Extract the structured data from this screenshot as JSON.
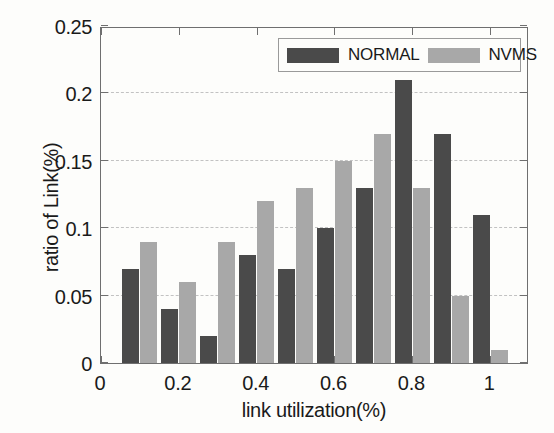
{
  "chart_data": {
    "type": "bar",
    "title": "",
    "xlabel": "link utilization(%)",
    "ylabel": "ratio of Link(%)",
    "categories": [
      0.1,
      0.2,
      0.3,
      0.4,
      0.5,
      0.6,
      0.7,
      0.8,
      0.9,
      1.0
    ],
    "series": [
      {
        "name": "NORMAL",
        "color": "#4a4a4a",
        "values": [
          0.07,
          0.04,
          0.02,
          0.08,
          0.07,
          0.1,
          0.13,
          0.21,
          0.17,
          0.11
        ]
      },
      {
        "name": "NVMS",
        "color": "#a8a8a8",
        "values": [
          0.09,
          0.06,
          0.09,
          0.12,
          0.13,
          0.15,
          0.17,
          0.13,
          0.05,
          0.01
        ]
      }
    ],
    "xlim": [
      0,
      1.1
    ],
    "ylim": [
      0,
      0.25
    ],
    "xticks": [
      0,
      0.2,
      0.4,
      0.6,
      0.8,
      1
    ],
    "xtick_labels": [
      "0",
      "0.2",
      "0.4",
      "0.6",
      "0.8",
      "1"
    ],
    "yticks": [
      0,
      0.05,
      0.1,
      0.15,
      0.2,
      0.25
    ],
    "ytick_labels": [
      "0",
      "0.05",
      "0.1",
      "0.15",
      "0.2",
      "0.25"
    ],
    "grid": "horizontal-dashed",
    "gridlines_at": [
      0.05,
      0.1,
      0.15,
      0.2
    ],
    "legend_position": "top-right",
    "legend_entries": [
      "NORMAL",
      "NVMS"
    ]
  },
  "figure": {
    "background_color": "#fdfdfb",
    "axis_color": "#6f6f6f",
    "grid_color": "#c2c2c2",
    "text_color": "#1a1a1a"
  }
}
